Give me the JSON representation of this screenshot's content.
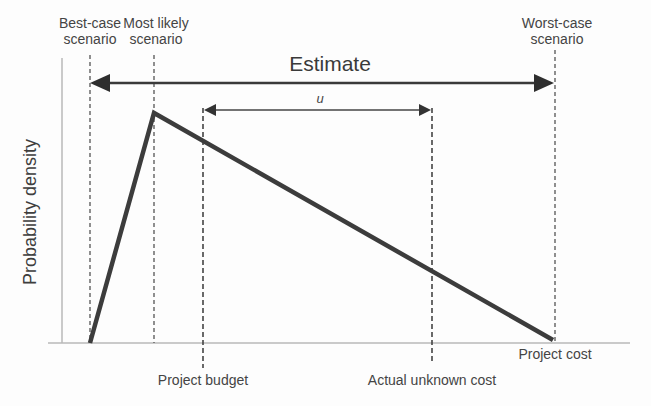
{
  "diagram": {
    "type": "triangular-probability-distribution",
    "ylabel": "Probability density",
    "top_labels": {
      "best_case": [
        "Best-case",
        "scenario"
      ],
      "most_likely": [
        "Most likely",
        "scenario"
      ],
      "worst_case": [
        "Worst-case",
        "scenario"
      ]
    },
    "estimate_arrow_label": "Estimate",
    "u_arrow_label": "u",
    "bottom_labels": {
      "project_budget": "Project budget",
      "actual_unknown_cost": "Actual unknown cost",
      "project_cost": "Project cost"
    },
    "colors": {
      "curve": "#3c3c3c",
      "axis": "#b5b5b5",
      "dashed": "#555555",
      "arrow": "#333333",
      "text": "#444444"
    }
  }
}
